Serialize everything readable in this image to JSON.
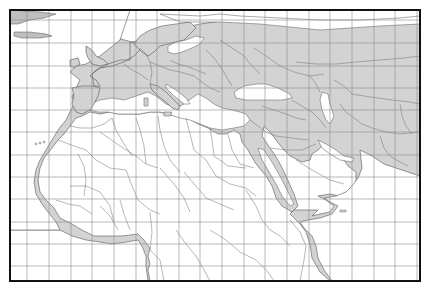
{
  "map": {
    "title": "",
    "region": "Europe, North Africa and the Middle East",
    "projection_view": {
      "frame": {
        "x": 10,
        "y": 10,
        "width": 410,
        "height": 271
      }
    },
    "colors": {
      "land": "#d3d3d3",
      "water": "#ffffff",
      "border": "#6e6e6e",
      "coastline": "#555555",
      "graticule": "#8a8a8a",
      "frame": "#111111"
    },
    "graticule": {
      "vertical_x": [
        27,
        49,
        71,
        92,
        114,
        136,
        157,
        179,
        200,
        222,
        244,
        265,
        287,
        309,
        330,
        352,
        374,
        395,
        417
      ],
      "horizontal_y": [
        20,
        43,
        66,
        88,
        110,
        132,
        155,
        177,
        199,
        222,
        244,
        266
      ]
    },
    "labels": []
  }
}
